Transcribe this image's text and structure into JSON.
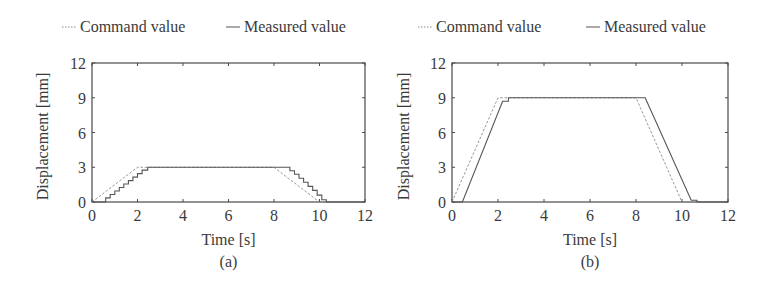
{
  "figure": {
    "legend": {
      "command_label": "Command value",
      "measured_label": "Measured value"
    },
    "colors": {
      "axis": "#4a4a4a",
      "command": "#8a8a8a",
      "measured": "#555555",
      "text": "#3a3a3a"
    }
  },
  "chart_data": [
    {
      "type": "line",
      "caption": "(a)",
      "title": "",
      "xlabel": "Time [s]",
      "ylabel": "Displacement [mm]",
      "xlim": [
        0,
        12
      ],
      "ylim": [
        0,
        12
      ],
      "xticks": [
        0,
        2,
        4,
        6,
        8,
        10,
        12
      ],
      "yticks": [
        0,
        3,
        6,
        9,
        12
      ],
      "grid": false,
      "legend_position": "top, outside",
      "series": [
        {
          "name": "Command value",
          "style": "dashed",
          "x": [
            0,
            2.0,
            8.0,
            10.0,
            12
          ],
          "y": [
            0,
            3.0,
            3.0,
            0,
            0
          ]
        },
        {
          "name": "Measured value",
          "style": "solid-staircase",
          "x": [
            0,
            0.6,
            0.6,
            0.8,
            0.8,
            1.0,
            1.0,
            1.2,
            1.2,
            1.4,
            1.4,
            1.6,
            1.6,
            1.8,
            1.8,
            2.0,
            2.0,
            2.2,
            2.2,
            2.45,
            2.45,
            8.7,
            8.7,
            8.9,
            8.9,
            9.1,
            9.1,
            9.3,
            9.3,
            9.5,
            9.5,
            9.7,
            9.7,
            9.9,
            9.9,
            10.1,
            10.1,
            10.3,
            10.3,
            12
          ],
          "y": [
            0,
            0,
            0.35,
            0.35,
            0.65,
            0.65,
            0.95,
            0.95,
            1.25,
            1.25,
            1.55,
            1.55,
            1.85,
            1.85,
            2.15,
            2.15,
            2.45,
            2.45,
            2.75,
            2.75,
            3.0,
            3.0,
            2.7,
            2.7,
            2.4,
            2.4,
            2.05,
            2.05,
            1.7,
            1.7,
            1.35,
            1.35,
            1.0,
            1.0,
            0.6,
            0.6,
            0.2,
            0.2,
            0,
            0
          ]
        }
      ]
    },
    {
      "type": "line",
      "caption": "(b)",
      "title": "",
      "xlabel": "Time [s]",
      "ylabel": "Displacement [mm]",
      "xlim": [
        0,
        12
      ],
      "ylim": [
        0,
        12
      ],
      "xticks": [
        0,
        2,
        4,
        6,
        8,
        10,
        12
      ],
      "yticks": [
        0,
        3,
        6,
        9,
        12
      ],
      "grid": false,
      "legend_position": "top, outside",
      "series": [
        {
          "name": "Command value",
          "style": "dashed",
          "x": [
            0,
            2.0,
            8.0,
            10.0,
            12
          ],
          "y": [
            0,
            9.0,
            9.0,
            0,
            0
          ]
        },
        {
          "name": "Measured value",
          "style": "solid",
          "x": [
            0,
            0.45,
            2.2,
            2.2,
            2.45,
            2.45,
            8.4,
            10.4,
            10.4,
            10.65,
            10.65,
            12
          ],
          "y": [
            0,
            0,
            8.7,
            8.7,
            8.7,
            9.0,
            9.0,
            0.15,
            0.15,
            0.15,
            0,
            0
          ]
        }
      ]
    }
  ]
}
